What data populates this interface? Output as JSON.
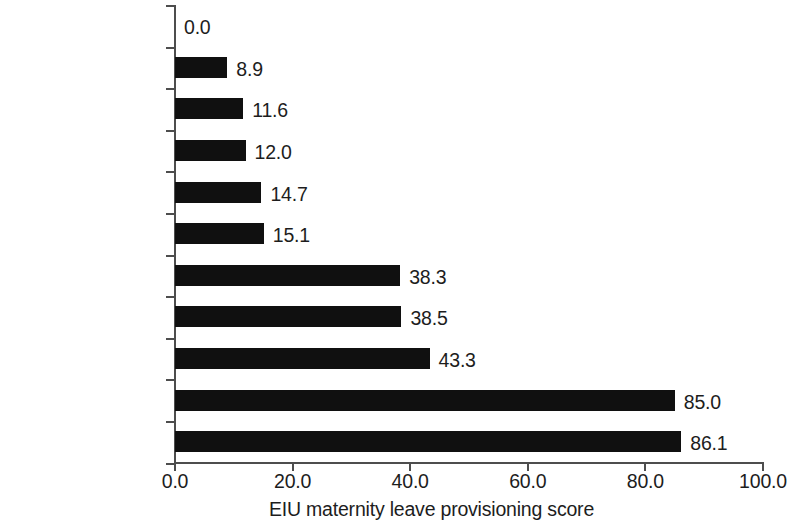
{
  "chart_data": {
    "type": "bar",
    "orientation": "horizontal",
    "title": "",
    "xlabel": "EIU maternity leave provisioning score",
    "ylabel": "",
    "xlim": [
      0.0,
      100.0
    ],
    "xticks": [
      "0.0",
      "20.0",
      "40.0",
      "60.0",
      "80.0",
      "100.0"
    ],
    "xtick_values": [
      0,
      20,
      40,
      60,
      80,
      100
    ],
    "grid": false,
    "legend": null,
    "bar_color": "#101010",
    "axis_color": "#4d4d4d",
    "background": "#ffffff",
    "categories": [
      "Australia",
      "Indonesia",
      "Malaysia",
      "China",
      "Hong Kong, China",
      "Singapore",
      "Philippines",
      "Korea, Rep. of",
      "Thailand",
      "Vietnam",
      "New Zealand"
    ],
    "values": [
      0.0,
      8.9,
      11.6,
      12.0,
      14.7,
      15.1,
      38.3,
      38.5,
      43.3,
      85.0,
      86.1
    ],
    "value_labels": [
      "0.0",
      "8.9",
      "11.6",
      "12.0",
      "14.7",
      "15.1",
      "38.3",
      "38.5",
      "43.3",
      "85.0",
      "86.1"
    ]
  }
}
